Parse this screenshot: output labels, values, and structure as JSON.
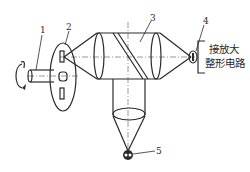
{
  "diagram": {
    "type": "optical-encoder-schematic",
    "components": [
      {
        "id": "1",
        "label": "1",
        "name": "shaft"
      },
      {
        "id": "2",
        "label": "2",
        "name": "code-disk"
      },
      {
        "id": "3",
        "label": "3",
        "name": "lens-and-beam-splitter-assembly"
      },
      {
        "id": "4",
        "label": "4",
        "name": "photodetector"
      },
      {
        "id": "5",
        "label": "5",
        "name": "light-source"
      }
    ],
    "circuit_text": {
      "line1": "接放大",
      "line2": "整形电路"
    }
  }
}
